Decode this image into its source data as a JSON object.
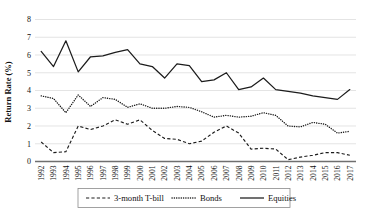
{
  "chart_data": {
    "type": "line",
    "title": "",
    "xlabel": "",
    "ylabel": "Return Rate (%)",
    "ylim": [
      0,
      8
    ],
    "yticks": [
      0,
      1,
      2,
      3,
      4,
      5,
      6,
      7,
      8
    ],
    "grid": true,
    "legend_position": "bottom",
    "categories": [
      "1992",
      "1993",
      "1994",
      "1995",
      "1996",
      "1997",
      "1998",
      "1999",
      "2000",
      "2001",
      "2002",
      "2003",
      "2004",
      "2005",
      "2006",
      "2007",
      "2008",
      "2009",
      "2010",
      "2011",
      "2012",
      "2013",
      "2014",
      "2015",
      "2016",
      "2017"
    ],
    "series": [
      {
        "name": "3-month T-bill",
        "style": "dashed",
        "values": [
          1.1,
          0.5,
          0.55,
          2.0,
          1.8,
          2.0,
          2.35,
          2.1,
          2.35,
          1.75,
          1.3,
          1.25,
          1.0,
          1.15,
          1.65,
          2.0,
          1.6,
          0.7,
          0.75,
          0.7,
          0.1,
          0.25,
          0.35,
          0.5,
          0.5,
          0.35
        ]
      },
      {
        "name": "Bonds",
        "style": "dotted",
        "values": [
          3.7,
          3.55,
          2.75,
          3.75,
          3.1,
          3.6,
          3.5,
          3.05,
          3.25,
          3.0,
          3.0,
          3.1,
          3.05,
          2.8,
          2.5,
          2.6,
          2.5,
          2.55,
          2.75,
          2.6,
          2.0,
          1.95,
          2.2,
          2.1,
          1.6,
          1.7
        ]
      },
      {
        "name": "Equities",
        "style": "solid",
        "values": [
          6.2,
          5.35,
          6.8,
          5.05,
          5.9,
          5.95,
          6.15,
          6.3,
          5.5,
          5.35,
          4.7,
          5.5,
          5.4,
          4.5,
          4.6,
          5.0,
          4.05,
          4.2,
          4.7,
          4.05,
          3.95,
          3.85,
          3.7,
          3.6,
          3.5,
          4.05
        ]
      }
    ]
  },
  "legend": {
    "items": [
      {
        "label": "3-month T-bill",
        "marker": "dashed-line-icon"
      },
      {
        "label": "Bonds",
        "marker": "dotted-line-icon"
      },
      {
        "label": "Equities",
        "marker": "solid-line-icon"
      }
    ]
  },
  "colors": {
    "series": "#1c1c1c",
    "grid": "#d9d9d9",
    "axis": "#6f6f6f",
    "background": "#ffffff"
  }
}
